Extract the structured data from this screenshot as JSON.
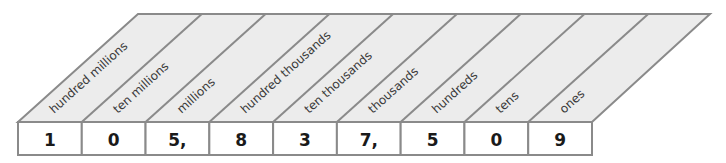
{
  "colors": {
    "header_fill": "#ececec",
    "box_fill": "#ffffff",
    "stroke": "#8a8a8a",
    "text": "#1a1a1a"
  },
  "columns": [
    {
      "place": "hundred millions",
      "digit": "1"
    },
    {
      "place": "ten millions",
      "digit": "0"
    },
    {
      "place": "millions",
      "digit": "5,"
    },
    {
      "place": "hundred thousands",
      "digit": "8"
    },
    {
      "place": "ten thousands",
      "digit": "3"
    },
    {
      "place": "thousands",
      "digit": "7,"
    },
    {
      "place": "hundreds",
      "digit": "5"
    },
    {
      "place": "tens",
      "digit": "0"
    },
    {
      "place": "ones",
      "digit": "9"
    }
  ],
  "number": "105,837,509"
}
